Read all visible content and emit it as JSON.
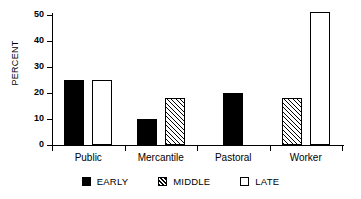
{
  "chart_data": {
    "type": "bar",
    "title": "",
    "xlabel": "",
    "ylabel": "PERCENT",
    "ylim": [
      0,
      50
    ],
    "yticks": [
      0,
      10,
      20,
      30,
      40,
      50
    ],
    "grid": false,
    "legend_position": "bottom",
    "categories": [
      "Public",
      "Mercantile",
      "Pastoral",
      "Worker"
    ],
    "series": [
      {
        "name": "EARLY",
        "fill": "solid-black",
        "values": [
          25,
          10,
          20,
          0
        ]
      },
      {
        "name": "MIDDLE",
        "fill": "diagonal-hatch",
        "values": [
          0,
          18,
          0,
          18
        ]
      },
      {
        "name": "LATE",
        "fill": "white-outline",
        "values": [
          25,
          0,
          0,
          51
        ]
      }
    ]
  },
  "axis": {
    "y_label": "PERCENT",
    "y_tick_labels": [
      "0",
      "10",
      "20",
      "30",
      "40",
      "50"
    ]
  },
  "legend": {
    "items": [
      {
        "label": "EARLY"
      },
      {
        "label": "MIDDLE"
      },
      {
        "label": "LATE"
      }
    ]
  },
  "colors": {
    "axis": "#000000",
    "early": "#000000",
    "middle": "#000000",
    "late": "#ffffff",
    "background": "#ffffff"
  }
}
